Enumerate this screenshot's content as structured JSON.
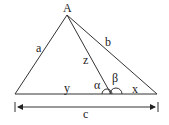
{
  "diagram": {
    "type": "triangle-with-cevian",
    "vertex_label": "A",
    "side_labels": {
      "left": "a",
      "right": "b",
      "cevian": "z",
      "base_left": "y",
      "base_right": "x",
      "base_total": "c"
    },
    "angle_labels": {
      "left": "α",
      "right": "β"
    },
    "colors": {
      "stroke": "#333333",
      "background": "#ffffff"
    }
  }
}
